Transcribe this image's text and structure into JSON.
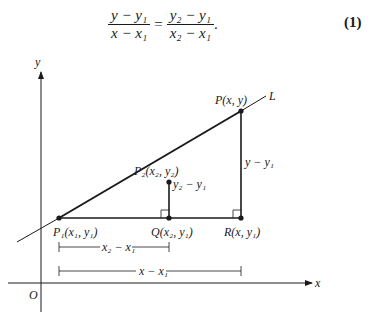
{
  "equation": {
    "lhs_num": "y − y₁",
    "lhs_den": "x − x₁",
    "equals": "=",
    "rhs_num": "y₂ − y₁",
    "rhs_den": "x₂ − x₁",
    "period": ".",
    "number": "(1)"
  },
  "diagram": {
    "axis_x_label": "x",
    "axis_y_label": "y",
    "origin_label": "O",
    "line_label": "L",
    "points": {
      "P1": "P₁(x₁, y₁)",
      "P2": "P₂(x₂, y₂)",
      "P": "P(x, y)",
      "Q": "Q(x₂, y₁)",
      "R": "R(x, y₁)"
    },
    "segments": {
      "rise_small": "y₂ − y₁",
      "rise_large": "y − y₁",
      "run_small": "x₂ − x₁",
      "run_large": "x − x₁"
    }
  }
}
